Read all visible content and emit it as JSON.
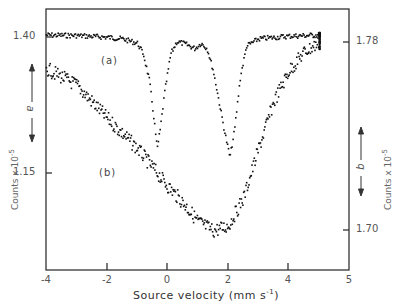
{
  "chart_data": {
    "type": "scatter",
    "title": "",
    "xlabel": "Source velocity (mm s-1)",
    "ylabel_left": "Counts x 10-5",
    "ylabel_right": "Counts x 10-5",
    "xlim": [
      -4,
      5
    ],
    "x_ticks": [
      "-4",
      "-2",
      "0",
      "2",
      "4",
      "5"
    ],
    "y_ticks_left": [
      "1.40",
      "1.15"
    ],
    "y_ticks_right": [
      "1.78",
      "1.70"
    ],
    "axis_arrows": {
      "left": "a",
      "right": "b"
    },
    "grid": false,
    "legend": "none",
    "series": [
      {
        "name": "(a)",
        "axis": "left",
        "description": "Two sharp absorption doublet-like dips on flat baseline",
        "baseline": 1.405,
        "points": [
          [
            -4.0,
            1.405
          ],
          [
            -3.0,
            1.404
          ],
          [
            -2.0,
            1.401
          ],
          [
            -1.5,
            1.398
          ],
          [
            -1.0,
            1.39
          ],
          [
            -0.8,
            1.37
          ],
          [
            -0.6,
            1.32
          ],
          [
            -0.45,
            1.25
          ],
          [
            -0.35,
            1.195
          ],
          [
            -0.25,
            1.23
          ],
          [
            -0.1,
            1.3
          ],
          [
            0.1,
            1.37
          ],
          [
            0.3,
            1.393
          ],
          [
            0.6,
            1.388
          ],
          [
            0.9,
            1.38
          ],
          [
            1.1,
            1.39
          ],
          [
            1.3,
            1.38
          ],
          [
            1.5,
            1.34
          ],
          [
            1.7,
            1.28
          ],
          [
            1.9,
            1.22
          ],
          [
            2.05,
            1.18
          ],
          [
            2.2,
            1.23
          ],
          [
            2.4,
            1.33
          ],
          [
            2.6,
            1.385
          ],
          [
            3.0,
            1.398
          ],
          [
            4.0,
            1.403
          ],
          [
            5.0,
            1.405
          ]
        ]
      },
      {
        "name": "(b)",
        "axis": "right",
        "description": "Broad single absorption dip",
        "points": [
          [
            -4.0,
            1.769
          ],
          [
            -3.0,
            1.762
          ],
          [
            -2.0,
            1.748
          ],
          [
            -1.0,
            1.735
          ],
          [
            -0.5,
            1.727
          ],
          [
            0.0,
            1.719
          ],
          [
            0.5,
            1.712
          ],
          [
            1.0,
            1.704
          ],
          [
            1.5,
            1.7
          ],
          [
            2.0,
            1.702
          ],
          [
            2.5,
            1.714
          ],
          [
            3.0,
            1.735
          ],
          [
            3.5,
            1.755
          ],
          [
            4.0,
            1.768
          ],
          [
            4.5,
            1.776
          ],
          [
            5.0,
            1.78
          ]
        ]
      }
    ]
  },
  "labels": {
    "series_a": "(a)",
    "series_b": "(b)",
    "arrow_a": "a",
    "arrow_b": "b",
    "ylabel_left": "Counts x 10",
    "ylabel_left_exp": "-5",
    "ylabel_right": "Counts x 10",
    "ylabel_right_exp": "-5",
    "xlabel": "Source velocity (mm s",
    "xlabel_exp": "-1",
    "xlabel_end": ")"
  }
}
